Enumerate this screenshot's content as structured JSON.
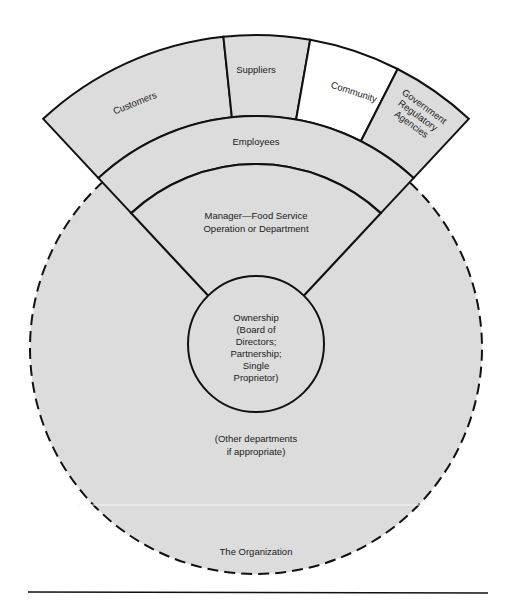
{
  "diagram": {
    "outer_segments": [
      {
        "id": "customers",
        "label": "Customers",
        "shaded": true
      },
      {
        "id": "suppliers",
        "label": "Suppliers",
        "shaded": true
      },
      {
        "id": "community",
        "label": "Community",
        "shaded": false
      },
      {
        "id": "government",
        "label_lines": [
          "Government",
          "Regulatory",
          "Agencies"
        ],
        "shaded": true
      }
    ],
    "employees": {
      "label": "Employees"
    },
    "manager": {
      "label_lines": [
        "Manager—Food Service",
        "Operation or Department"
      ]
    },
    "ownership": {
      "label_lines": [
        "Ownership",
        "(Board of",
        "Directors;",
        "Partnership;",
        "Single",
        "Proprietor)"
      ]
    },
    "other_departments": {
      "label_lines": [
        "(Other departments",
        "if appropriate)"
      ]
    },
    "organization": {
      "label": "The Organization"
    },
    "colors": {
      "shade": "#dcdcdc",
      "line": "#111111",
      "background": "#ffffff"
    }
  }
}
